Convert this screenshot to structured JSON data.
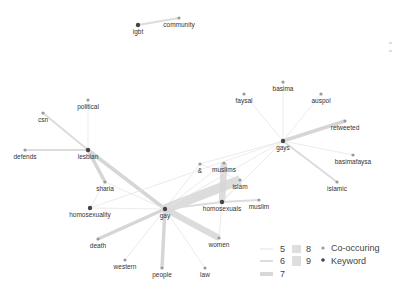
{
  "diagram": {
    "type": "keyword-cooccurrence-network",
    "colors": {
      "edge": "#d6d6d6",
      "edge_thin": "#e4e4e4",
      "keyword_node": "#444444",
      "cooccurring_node": "#9a9a9a",
      "label": "#333333"
    },
    "nodes": [
      {
        "id": "igbt",
        "label": "igbt",
        "type": "keyword",
        "x": 138,
        "y": 25
      },
      {
        "id": "community",
        "label": "community",
        "type": "co-occurring",
        "x": 179,
        "y": 18
      },
      {
        "id": "political",
        "label": "political",
        "type": "co-occurring",
        "x": 88,
        "y": 100
      },
      {
        "id": "csn",
        "label": "csn",
        "type": "co-occurring",
        "x": 43,
        "y": 113
      },
      {
        "id": "defends",
        "label": "defends",
        "type": "co-occurring",
        "x": 25,
        "y": 150
      },
      {
        "id": "lesbian",
        "label": "lesbian",
        "type": "keyword",
        "x": 88,
        "y": 150
      },
      {
        "id": "sharia",
        "label": "sharia",
        "type": "co-occurring",
        "x": 105,
        "y": 182
      },
      {
        "id": "homosexuality",
        "label": "homosexuality",
        "type": "keyword",
        "x": 90,
        "y": 208
      },
      {
        "id": "gay",
        "label": "gay",
        "type": "keyword",
        "x": 165,
        "y": 209
      },
      {
        "id": "death",
        "label": "death",
        "type": "co-occurring",
        "x": 98,
        "y": 239
      },
      {
        "id": "western",
        "label": "western",
        "type": "co-occurring",
        "x": 125,
        "y": 260
      },
      {
        "id": "people",
        "label": "people",
        "type": "co-occurring",
        "x": 162,
        "y": 268
      },
      {
        "id": "law",
        "label": "law",
        "type": "co-occurring",
        "x": 205,
        "y": 268
      },
      {
        "id": "women",
        "label": "women",
        "type": "co-occurring",
        "x": 219,
        "y": 238
      },
      {
        "id": "amp",
        "label": "&",
        "type": "co-occurring",
        "x": 200,
        "y": 164
      },
      {
        "id": "muslims",
        "label": "muslims",
        "type": "co-occurring",
        "x": 224,
        "y": 163
      },
      {
        "id": "islam",
        "label": "islam",
        "type": "co-occurring",
        "x": 240,
        "y": 180
      },
      {
        "id": "homosexuals",
        "label": "homosexuals",
        "type": "keyword",
        "x": 222,
        "y": 202
      },
      {
        "id": "muslim",
        "label": "muslim",
        "type": "co-occurring",
        "x": 259,
        "y": 200
      },
      {
        "id": "gays",
        "label": "gays",
        "type": "keyword",
        "x": 283,
        "y": 141
      },
      {
        "id": "faysal",
        "label": "faysal",
        "type": "co-occurring",
        "x": 244,
        "y": 94
      },
      {
        "id": "basima",
        "label": "basima",
        "type": "co-occurring",
        "x": 283,
        "y": 82
      },
      {
        "id": "auspol",
        "label": "auspol",
        "type": "co-occurring",
        "x": 321,
        "y": 94
      },
      {
        "id": "retweeted",
        "label": "retweeted",
        "type": "co-occurring",
        "x": 345,
        "y": 121
      },
      {
        "id": "basimafaysa",
        "label": "basimafaysa",
        "type": "co-occurring",
        "x": 353,
        "y": 155
      },
      {
        "id": "islamic",
        "label": "islamic",
        "type": "co-occurring",
        "x": 337,
        "y": 182
      }
    ],
    "edges": [
      {
        "source": "igbt",
        "target": "community",
        "weight": 6
      },
      {
        "source": "lesbian",
        "target": "csn",
        "weight": 6
      },
      {
        "source": "lesbian",
        "target": "political",
        "weight": 5
      },
      {
        "source": "lesbian",
        "target": "defends",
        "weight": 6
      },
      {
        "source": "lesbian",
        "target": "sharia",
        "weight": 7
      },
      {
        "source": "lesbian",
        "target": "gay",
        "weight": 7
      },
      {
        "source": "sharia",
        "target": "homosexuality",
        "weight": 5
      },
      {
        "source": "sharia",
        "target": "gay",
        "weight": 5
      },
      {
        "source": "homosexuality",
        "target": "gay",
        "weight": 5
      },
      {
        "source": "gay",
        "target": "death",
        "weight": 7
      },
      {
        "source": "gay",
        "target": "western",
        "weight": 5
      },
      {
        "source": "gay",
        "target": "people",
        "weight": 7
      },
      {
        "source": "gay",
        "target": "law",
        "weight": 5
      },
      {
        "source": "gay",
        "target": "women",
        "weight": 8
      },
      {
        "source": "gay",
        "target": "amp",
        "weight": 5
      },
      {
        "source": "gay",
        "target": "muslims",
        "weight": 5
      },
      {
        "source": "gay",
        "target": "islam",
        "weight": 9
      },
      {
        "source": "gay",
        "target": "homosexuals",
        "weight": 6
      },
      {
        "source": "gay",
        "target": "gays",
        "weight": 5
      },
      {
        "source": "homosexuals",
        "target": "muslims",
        "weight": 8
      },
      {
        "source": "homosexuals",
        "target": "islam",
        "weight": 5
      },
      {
        "source": "homosexuals",
        "target": "muslim",
        "weight": 6
      },
      {
        "source": "homosexuals",
        "target": "women",
        "weight": 5
      },
      {
        "source": "amp",
        "target": "islam",
        "weight": 5
      },
      {
        "source": "gays",
        "target": "faysal",
        "weight": 5
      },
      {
        "source": "gays",
        "target": "basima",
        "weight": 5
      },
      {
        "source": "gays",
        "target": "auspol",
        "weight": 5
      },
      {
        "source": "gays",
        "target": "retweeted",
        "weight": 7
      },
      {
        "source": "gays",
        "target": "basimafaysa",
        "weight": 5
      },
      {
        "source": "gays",
        "target": "islamic",
        "weight": 6
      },
      {
        "source": "gays",
        "target": "amp",
        "weight": 5
      },
      {
        "source": "gays",
        "target": "homosexuals",
        "weight": 5
      },
      {
        "source": "gays",
        "target": "homosexuality",
        "weight": 5
      }
    ]
  },
  "legend": {
    "weights": [
      {
        "label": "5",
        "thickness": 1
      },
      {
        "label": "6",
        "thickness": 2
      },
      {
        "label": "7",
        "thickness": 4
      },
      {
        "label": "8",
        "thickness": 7
      },
      {
        "label": "9",
        "thickness": 10
      }
    ],
    "node_types": [
      {
        "label": "Co-occuring",
        "color": "#9a9a9a"
      },
      {
        "label": "Keyword",
        "color": "#444444"
      }
    ]
  }
}
